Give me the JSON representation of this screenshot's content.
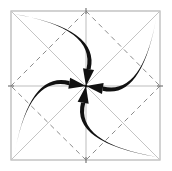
{
  "figure": {
    "title": "",
    "caption": "",
    "background_color": "#ffffff"
  },
  "chart_data": {
    "type": "diagram",
    "title": "",
    "xlabel": "",
    "ylabel": "",
    "canvas": {
      "width": 172,
      "height": 171
    },
    "frame": {
      "left": 11,
      "top": 11,
      "right": 160,
      "bottom": 160,
      "stroke_color": "#b4b4b4",
      "stroke_width": 1.2
    },
    "center_point": {
      "x": 86,
      "y": 86
    },
    "corners": [
      {
        "name": "top-left",
        "x": 11,
        "y": 11
      },
      {
        "name": "top-right",
        "x": 160,
        "y": 11
      },
      {
        "name": "bottom-right",
        "x": 160,
        "y": 160
      },
      {
        "name": "bottom-left",
        "x": 11,
        "y": 160
      }
    ],
    "edge_midpoints": [
      {
        "name": "top-mid",
        "x": 86,
        "y": 11
      },
      {
        "name": "right-mid",
        "x": 160,
        "y": 86
      },
      {
        "name": "bottom-mid",
        "x": 86,
        "y": 160
      },
      {
        "name": "left-mid",
        "x": 11,
        "y": 86
      }
    ],
    "guide_lines": {
      "midlines": {
        "style": "solid",
        "stroke_color": "#bdbdbd",
        "stroke_width": 1.0,
        "segments": [
          {
            "name": "horizontal-midline",
            "x1": 11,
            "y1": 86,
            "x2": 160,
            "y2": 86
          },
          {
            "name": "vertical-midline",
            "x1": 86,
            "y1": 11,
            "x2": 86,
            "y2": 160
          }
        ]
      },
      "diagonals": {
        "style": "solid",
        "stroke_color": "#c4c4c4",
        "stroke_width": 1.0,
        "segments": [
          {
            "name": "diagonal-tl-br",
            "x1": 11,
            "y1": 11,
            "x2": 160,
            "y2": 160
          },
          {
            "name": "diagonal-tr-bl",
            "x1": 160,
            "y1": 11,
            "x2": 11,
            "y2": 160
          }
        ]
      },
      "diamond": {
        "style": "dashed",
        "dash_pattern": "5,4",
        "stroke_color": "#8c8c8c",
        "stroke_width": 1.0,
        "points": "86,11 160,86 86,160 11,86",
        "segments": [
          {
            "name": "diamond-top-right",
            "x1": 86,
            "y1": 11,
            "x2": 160,
            "y2": 86
          },
          {
            "name": "diamond-right-bottom",
            "x1": 160,
            "y1": 86,
            "x2": 86,
            "y2": 160
          },
          {
            "name": "diamond-bottom-left",
            "x1": 86,
            "y1": 160,
            "x2": 11,
            "y2": 86
          },
          {
            "name": "diamond-left-top",
            "x1": 11,
            "y1": 86,
            "x2": 86,
            "y2": 11
          }
        ]
      }
    },
    "arrows": {
      "count": 4,
      "stroke_color": "#111111",
      "fill_color": "#111111",
      "max_stroke_width": 4.2,
      "min_stroke_width": 0.8,
      "rotation_sense": "clockwise-inward",
      "items": [
        {
          "name": "arrow-top-left-to-center",
          "from": {
            "x": 14,
            "y": 14
          },
          "to": {
            "x": 86,
            "y": 86
          },
          "control": {
            "x": 96,
            "y": 28
          },
          "head_angle_deg": 45
        },
        {
          "name": "arrow-top-right-to-center",
          "from": {
            "x": 157,
            "y": 14
          },
          "to": {
            "x": 86,
            "y": 86
          },
          "control": {
            "x": 143,
            "y": 96
          },
          "head_angle_deg": 135
        },
        {
          "name": "arrow-bottom-right-to-center",
          "from": {
            "x": 157,
            "y": 157
          },
          "to": {
            "x": 86,
            "y": 86
          },
          "control": {
            "x": 75,
            "y": 143
          },
          "head_angle_deg": 225
        },
        {
          "name": "arrow-bottom-left-to-center",
          "from": {
            "x": 14,
            "y": 157
          },
          "to": {
            "x": 86,
            "y": 86
          },
          "control": {
            "x": 28,
            "y": 75
          },
          "head_angle_deg": 315
        }
      ]
    },
    "legend": [],
    "annotations": [],
    "tick_labels": [],
    "grid": true
  }
}
